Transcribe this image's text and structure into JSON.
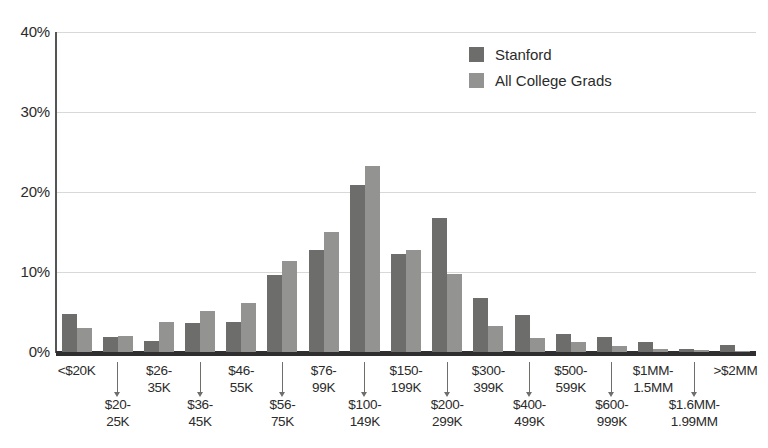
{
  "chart_data": {
    "type": "bar",
    "title": "",
    "subtitle": "",
    "xlabel": "",
    "ylabel": "",
    "ylim": [
      0,
      40
    ],
    "grid": true,
    "legend_position": "top-right",
    "y_ticks": [
      "0%",
      "10%",
      "20%",
      "30%",
      "40%"
    ],
    "y_tick_values": [
      0,
      10,
      20,
      30,
      40
    ],
    "categories": [
      "<$20K",
      "$20-\n25K",
      "$26-\n35K",
      "$36-\n45K",
      "$46-\n55K",
      "$56-\n75K",
      "$76-\n99K",
      "$100-\n149K",
      "$150-\n199K",
      "$200-\n299K",
      "$300-\n399K",
      "$400-\n499K",
      "$500-\n599K",
      "$600-\n999K",
      "$1MM-\n1.5MM",
      "$1.6MM-\n1.99MM",
      ">$2MM"
    ],
    "categories_flat": [
      "<$20K",
      "$20-25K",
      "$26-35K",
      "$36-45K",
      "$46-55K",
      "$56-75K",
      "$76-99K",
      "$100-149K",
      "$150-199K",
      "$200-299K",
      "$300-399K",
      "$400-499K",
      "$500-599K",
      "$600-999K",
      "$1MM-1.5MM",
      "$1.6MM-1.99MM",
      ">$2MM"
    ],
    "series": [
      {
        "name": "Stanford",
        "color": "#6d6d6b",
        "values": [
          4.7,
          1.9,
          1.4,
          3.6,
          3.7,
          9.6,
          12.7,
          20.9,
          12.2,
          16.7,
          6.8,
          4.6,
          2.2,
          1.9,
          1.3,
          0.4,
          0.9
        ]
      },
      {
        "name": "All College Grads",
        "color": "#939391",
        "values": [
          3.0,
          2.0,
          3.8,
          5.1,
          6.1,
          11.4,
          15.0,
          23.3,
          12.8,
          9.8,
          3.3,
          1.7,
          1.3,
          0.8,
          0.4,
          0.3,
          0.1
        ]
      }
    ]
  },
  "legend": {
    "items": [
      {
        "label": "Stanford",
        "color": "#6d6d6b"
      },
      {
        "label": "All College Grads",
        "color": "#939391"
      }
    ]
  },
  "axis": {
    "y_labels": [
      "40%",
      "30%",
      "20%",
      "10%",
      "0%"
    ]
  },
  "xaxis": {
    "top_row": [
      {
        "index": 0,
        "text": "<$20K"
      },
      {
        "index": 2,
        "text": "$26-\n35K"
      },
      {
        "index": 4,
        "text": "$46-\n55K"
      },
      {
        "index": 6,
        "text": "$76-\n99K"
      },
      {
        "index": 8,
        "text": "$150-\n199K"
      },
      {
        "index": 10,
        "text": "$300-\n399K"
      },
      {
        "index": 12,
        "text": "$500-\n599K"
      },
      {
        "index": 14,
        "text": "$1MM-\n1.5MM"
      },
      {
        "index": 16,
        "text": ">$2MM"
      }
    ],
    "bottom_row": [
      {
        "index": 1,
        "text": "$20-\n25K"
      },
      {
        "index": 3,
        "text": "$36-\n45K"
      },
      {
        "index": 5,
        "text": "$56-\n75K"
      },
      {
        "index": 7,
        "text": "$100-\n149K"
      },
      {
        "index": 9,
        "text": "$200-\n299K"
      },
      {
        "index": 11,
        "text": "$400-\n499K"
      },
      {
        "index": 13,
        "text": "$600-\n999K"
      },
      {
        "index": 15,
        "text": "$1.6MM-\n1.99MM"
      }
    ]
  },
  "colors": {
    "series_stanford": "#6d6d6b",
    "series_all_grads": "#939391",
    "gridline": "#d8d8d6",
    "axis": "#2f2f2f",
    "text": "#2b2b2b"
  }
}
